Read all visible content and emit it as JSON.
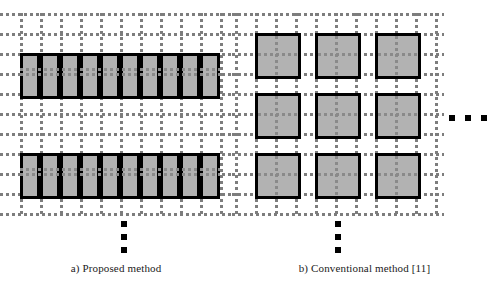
{
  "figure": {
    "panels": [
      {
        "id": "panel-a",
        "caption": "a) Proposed method",
        "layout": "strips",
        "description": "Vertical strip partitions spanning full grid rows",
        "grid": {
          "cell_size_px": 20,
          "dot_color": "#7d7d7d",
          "origin_x": 20,
          "origin_y": 13,
          "cols": 10,
          "rows": 10
        },
        "blocks": {
          "fill_color": "#b2b2b2",
          "border_color": "#000000",
          "border_width_px": 3,
          "strip_width_px": 20,
          "strip_height_px": 40,
          "strips_per_row": 10,
          "rows": 2,
          "row_tops": [
            53,
            153
          ]
        },
        "ellipsis": {
          "orientation": "vertical",
          "dots": 3,
          "color": "#000000",
          "x": 121,
          "y": 221
        }
      },
      {
        "id": "panel-b",
        "caption": "b) Conventional method [11]",
        "layout": "squares",
        "description": "Isolated square macroblocks on dotted grid",
        "grid": {
          "cell_size_px": 20,
          "dot_color": "#7d7d7d",
          "origin_x": 3,
          "origin_y": 13,
          "cols": 10,
          "rows": 10
        },
        "blocks": {
          "fill_color": "#b2b2b2",
          "border_color": "#000000",
          "border_width_px": 3,
          "square_size_px": 40,
          "cols": 3,
          "rows": 3,
          "col_lefts": [
            23,
            83,
            143
          ],
          "row_tops": [
            33,
            93,
            153
          ]
        },
        "ellipsis": {
          "orientation": "vertical",
          "dots": 3,
          "color": "#000000",
          "x": 103,
          "y": 221
        }
      }
    ],
    "side_ellipsis": {
      "orientation": "horizontal",
      "dots": 3,
      "color": "#000000",
      "x": 449,
      "y": 115
    },
    "colors": {
      "block_fill": "#b2b2b2",
      "block_border": "#000000",
      "grid_dot": "#7d7d7d",
      "background": "#ffffff",
      "text": "#1a1a1a"
    }
  }
}
